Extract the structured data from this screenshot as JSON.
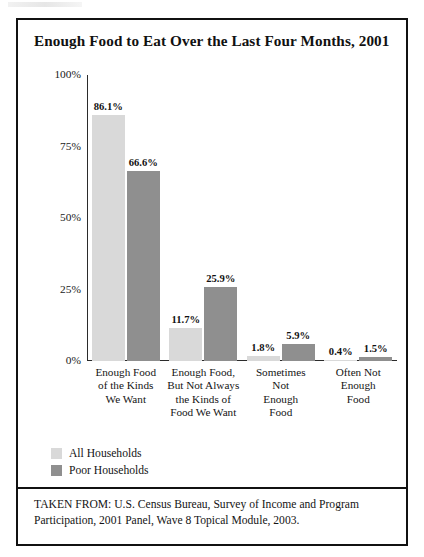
{
  "figure": {
    "title": "Enough Food to Eat Over the Last Four Months, 2001",
    "source_note": "TAKEN FROM: U.S. Census Bureau, Survey of Income and Program Participation, 2001 Panel, Wave 8 Topical Module, 2003."
  },
  "legend": {
    "items": [
      {
        "label": "All Households",
        "color": "#d9d9d9"
      },
      {
        "label": "Poor Households",
        "color": "#8f8f8f"
      }
    ]
  },
  "axis": {
    "y_ticks": [
      "100%",
      "75%",
      "50%",
      "25%",
      "0%"
    ]
  },
  "chart_data": {
    "type": "bar",
    "title": "Enough Food to Eat Over the Last Four Months, 2001",
    "xlabel": "",
    "ylabel": "",
    "ylim": [
      0,
      100
    ],
    "ytick_labels": [
      "0%",
      "25%",
      "50%",
      "75%",
      "100%"
    ],
    "ytick_values": [
      0,
      25,
      50,
      75,
      100
    ],
    "grid": false,
    "legend_position": "bottom-left",
    "categories": [
      "Enough Food of the Kinds We Want",
      "Enough Food, But Not Always the Kinds of Food We Want",
      "Sometimes Not Enough Food",
      "Often Not Enough Food"
    ],
    "category_lines": [
      [
        "Enough Food",
        "of the Kinds",
        "We Want"
      ],
      [
        "Enough Food,",
        "But Not Always",
        "the Kinds of",
        "Food We Want"
      ],
      [
        "Sometimes",
        "Not",
        "Enough",
        "Food"
      ],
      [
        "Often Not",
        "Enough",
        "Food"
      ]
    ],
    "series": [
      {
        "name": "All Households",
        "color": "#d9d9d9",
        "values": [
          86.1,
          11.7,
          1.8,
          0.4
        ],
        "labels": [
          "86.1%",
          "11.7%",
          "1.8%",
          "0.4%"
        ]
      },
      {
        "name": "Poor Households",
        "color": "#8f8f8f",
        "values": [
          66.6,
          25.9,
          5.9,
          1.5
        ],
        "labels": [
          "66.6%",
          "25.9%",
          "5.9%",
          "1.5%"
        ]
      }
    ],
    "source": "TAKEN FROM: U.S. Census Bureau, Survey of Income and Program Participation, 2001 Panel, Wave 8 Topical Module, 2003."
  }
}
